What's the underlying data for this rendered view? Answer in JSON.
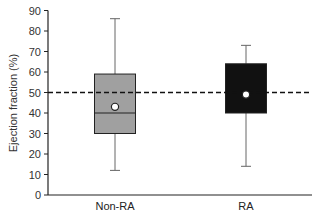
{
  "chart_data": {
    "type": "box",
    "title": "",
    "xlabel": "",
    "ylabel": "Ejection fraction (%)",
    "ylim": [
      0,
      90
    ],
    "yticks": [
      0,
      10,
      20,
      30,
      40,
      50,
      60,
      70,
      80,
      90
    ],
    "grid": false,
    "legend": null,
    "categories": [
      "Non-RA",
      "RA"
    ],
    "series": [
      {
        "name": "Non-RA",
        "whisker_low": 12,
        "q1": 30,
        "median": 40,
        "q3": 59,
        "whisker_high": 86,
        "mean": 43,
        "fill": "#a0a0a0"
      },
      {
        "name": "RA",
        "whisker_low": 14,
        "q1": 40,
        "median": null,
        "q3": 64,
        "whisker_high": 73,
        "mean": 49,
        "fill": "#111111"
      }
    ],
    "annotations": [
      {
        "type": "hline",
        "y": 50,
        "style": "dashed",
        "color": "#111111"
      }
    ]
  },
  "labels": {
    "ylabel": "Ejection fraction (%)",
    "cat0": "Non-RA",
    "cat1": "RA"
  }
}
